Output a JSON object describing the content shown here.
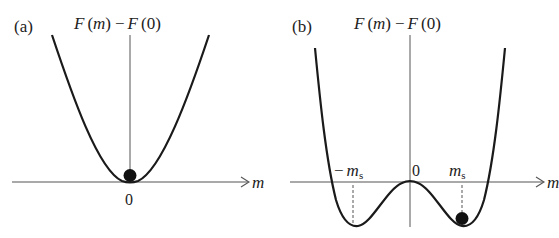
{
  "figure": {
    "panels": [
      {
        "id": "a",
        "label": "(a)",
        "y_axis_label": "F(m) − F(0)",
        "y_label_parts": {
          "f1": "F",
          "arg1": "m",
          "minus": "−",
          "f2": "F",
          "arg2": "0"
        },
        "x_axis_label": "m",
        "origin_label": "0",
        "description": "Single-well parabola with minimum at m = 0; ball rests at the minimum"
      },
      {
        "id": "b",
        "label": "(b)",
        "y_axis_label": "F(m) − F(0)",
        "y_label_parts": {
          "f1": "F",
          "arg1": "m",
          "minus": "−",
          "f2": "F",
          "arg2": "0"
        },
        "x_axis_label": "m",
        "origin_label": "0",
        "neg_min_label": {
          "sign": "−",
          "sym": "m",
          "sub": "s"
        },
        "pos_min_label": {
          "sym": "m",
          "sub": "s"
        },
        "description": "Double-well potential with local maximum at m = 0 and minima at ±m_s; ball rests at +m_s"
      }
    ],
    "colors": {
      "curve": "#1a1a1a",
      "axis": "#555555",
      "ball": "#111111",
      "text": "#222222"
    }
  }
}
